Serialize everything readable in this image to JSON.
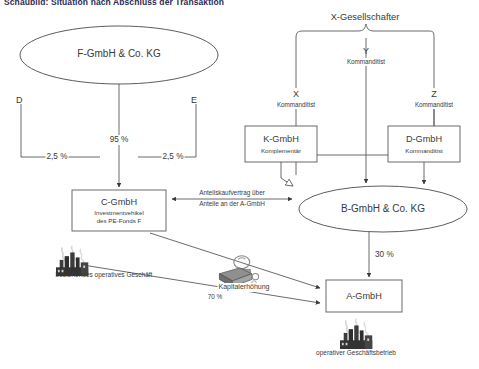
{
  "title": "Schaubild: Situation nach Abschluss der Transaktion",
  "nodes": {
    "f_kg": {
      "name": "F-GmbH & Co. KG"
    },
    "c_gmbh": {
      "name": "C-GmbH",
      "role": "Investmentvehikel",
      "role2": "des PE-Fonds F"
    },
    "b_kg": {
      "name": "B-GmbH & Co. KG"
    },
    "a_gmbh": {
      "name": "A-GmbH"
    },
    "k_gmbh": {
      "name": "K-GmbH",
      "role": "Komplementär"
    },
    "d_gmbh": {
      "name": "D-GmbH",
      "role": "Kommanditist"
    },
    "x_gesellschafter": {
      "name": "X-Gesellschafter"
    },
    "x": {
      "name": "X",
      "role": "Kommanditist"
    },
    "y": {
      "name": "Y",
      "role": "Kommanditist"
    },
    "z": {
      "name": "Z",
      "role": "Kommanditist"
    },
    "d": {
      "name": "D"
    },
    "e": {
      "name": "E"
    }
  },
  "edges": {
    "f_to_c": "95 %",
    "d_to_c": "2,5 %",
    "e_to_c": "2,5 %",
    "b_to_a": "30 %",
    "c_to_a": "70 %",
    "share_purchase_l1": "Anteilskaufvertrag über",
    "share_purchase_l2": "Anteile an der A-GmbH",
    "capital_increase": "Kapitalerhöhung"
  },
  "annotations": {
    "existing_business": "bestehendes operatives Geschäft",
    "operating_business": "operativer Geschäftsbetrieb"
  },
  "icons": {
    "factory_left": "factory-icon",
    "factory_bottom": "factory-icon",
    "money": "money-cash-icon"
  },
  "colors": {
    "line": "#5a5a5a",
    "text": "#3a3a3a",
    "title": "#2b2b55",
    "background": "#ffffff"
  }
}
